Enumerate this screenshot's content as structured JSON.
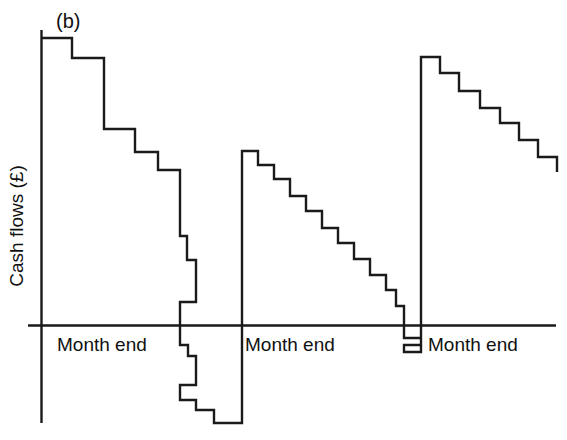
{
  "figure": {
    "panel_label": "(b)",
    "background_color": "#ffffff",
    "line_color": "#1a1a1a",
    "axis_color": "#1a1a1a"
  },
  "chart_data": {
    "type": "line",
    "title": "(b)",
    "subtitle": "",
    "xlabel": "",
    "ylabel": "Cash flows (£)",
    "grid": false,
    "legend": null,
    "annotations": [
      {
        "text": "(b)",
        "x_px": 57,
        "y_px": 27
      }
    ],
    "x_tick_labels": [
      "Month end",
      "Month end",
      "Month end"
    ],
    "x_tick_label_positions_px": [
      113,
      297,
      480
    ],
    "axis_ranges": {
      "x_px": [
        41,
        556
      ],
      "y_zero_px": 325,
      "y_top_px": 30,
      "y_bottom_px": 423
    },
    "series": [
      {
        "name": "Cash balance",
        "step_type": "post",
        "points_px": [
          [
            41,
            38
          ],
          [
            72,
            38
          ],
          [
            72,
            58
          ],
          [
            104,
            58
          ],
          [
            104,
            129
          ],
          [
            135,
            129
          ],
          [
            135,
            152
          ],
          [
            158,
            152
          ],
          [
            158,
            170
          ],
          [
            180,
            170
          ],
          [
            180,
            236
          ],
          [
            187,
            236
          ],
          [
            187,
            260
          ],
          [
            196,
            260
          ],
          [
            196,
            302
          ],
          [
            180,
            302
          ],
          [
            180,
            345
          ],
          [
            188,
            345
          ],
          [
            188,
            356
          ],
          [
            196,
            356
          ],
          [
            196,
            385
          ],
          [
            180,
            385
          ],
          [
            180,
            400
          ],
          [
            196,
            400
          ],
          [
            196,
            410
          ],
          [
            214,
            410
          ],
          [
            214,
            423
          ],
          [
            242,
            423
          ],
          [
            242,
            151
          ],
          [
            258,
            151
          ],
          [
            258,
            165
          ],
          [
            274,
            165
          ],
          [
            274,
            179
          ],
          [
            290,
            179
          ],
          [
            290,
            196
          ],
          [
            306,
            196
          ],
          [
            306,
            211
          ],
          [
            322,
            211
          ],
          [
            322,
            228
          ],
          [
            338,
            228
          ],
          [
            338,
            243
          ],
          [
            354,
            243
          ],
          [
            354,
            259
          ],
          [
            370,
            259
          ],
          [
            370,
            275
          ],
          [
            386,
            275
          ],
          [
            386,
            290
          ],
          [
            396,
            290
          ],
          [
            396,
            306
          ],
          [
            404,
            306
          ],
          [
            404,
            325
          ],
          [
            404,
            338
          ],
          [
            421,
            338
          ],
          [
            421,
            345
          ],
          [
            404,
            345
          ],
          [
            404,
            352
          ],
          [
            421,
            352
          ],
          [
            421,
            57
          ],
          [
            440,
            57
          ],
          [
            440,
            73
          ],
          [
            459,
            73
          ],
          [
            459,
            91
          ],
          [
            480,
            91
          ],
          [
            480,
            108
          ],
          [
            500,
            108
          ],
          [
            500,
            123
          ],
          [
            519,
            123
          ],
          [
            519,
            140
          ],
          [
            538,
            140
          ],
          [
            538,
            157
          ],
          [
            557,
            157
          ],
          [
            557,
            172
          ]
        ]
      }
    ]
  },
  "axes": {
    "y_axis_label": "Cash flows (£)",
    "x_axis_tick_labels": [
      {
        "id": "month-end-1",
        "label": "Month end"
      },
      {
        "id": "month-end-2",
        "label": "Month end"
      },
      {
        "id": "month-end-3",
        "label": "Month end"
      }
    ]
  }
}
